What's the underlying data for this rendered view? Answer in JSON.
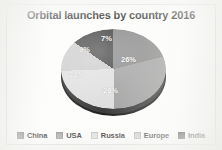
{
  "chart_data": {
    "type": "pie",
    "title": "Orbital launches by country 2016",
    "categories": [
      "China",
      "USA",
      "Russia",
      "Europe",
      "India"
    ],
    "values": [
      26,
      26,
      22,
      9,
      7
    ],
    "value_labels": [
      "26%",
      "26%",
      "22%",
      "9%",
      "7%"
    ],
    "unit": "%",
    "legend_position": "bottom",
    "grid": false,
    "three_d": true,
    "colors": [
      "#8d8d8d",
      "#a5a5a5",
      "#e2e2e2",
      "#cfcfcf",
      "#4a4a4a"
    ],
    "slices": [
      {
        "label": "China",
        "value": 26,
        "display": "26%",
        "color": "#8d8d8d"
      },
      {
        "label": "USA",
        "value": 26,
        "display": "26%",
        "color": "#a5a5a5"
      },
      {
        "label": "Russia",
        "value": 22,
        "display": "22%",
        "color": "#e2e2e2"
      },
      {
        "label": "Europe",
        "value": 9,
        "display": "9%",
        "color": "#cfcfcf"
      },
      {
        "label": "India",
        "value": 7,
        "display": "7%",
        "color": "#4a4a4a"
      }
    ]
  },
  "title": "Orbital launches by country 2016",
  "labels": {
    "china_pct": "26%",
    "usa_pct": "26%",
    "russia_pct": "22%",
    "europe_pct": "9%",
    "india_pct": "7%"
  },
  "legend": {
    "items": [
      {
        "label": "China",
        "color": "#8d8d8d"
      },
      {
        "label": "USA",
        "color": "#a5a5a5"
      },
      {
        "label": "Russia",
        "color": "#e2e2e2"
      },
      {
        "label": "Europe",
        "color": "#cfcfcf"
      },
      {
        "label": "India",
        "color": "#4a4a4a"
      }
    ]
  }
}
